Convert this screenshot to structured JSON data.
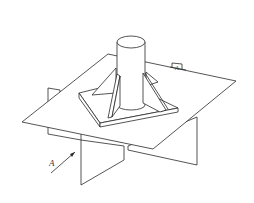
{
  "figure": {
    "labels": {
      "view_arrow": "A",
      "section_mark": "A"
    },
    "colors": {
      "line": "#2a2a2a",
      "background": "#ffffff"
    }
  }
}
